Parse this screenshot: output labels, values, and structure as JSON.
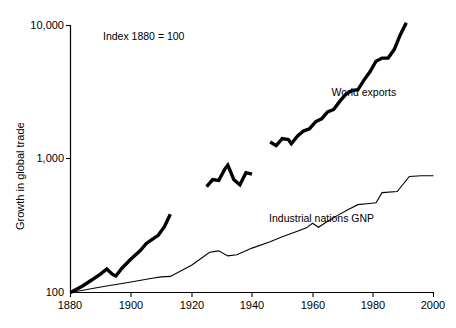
{
  "chart_data": {
    "type": "line",
    "title": "",
    "annotation": "Index 1880 = 100",
    "xlabel": "",
    "ylabel": "Growth in global trade",
    "yscale": "log",
    "ylim": [
      100,
      10000
    ],
    "xlim": [
      1880,
      2000
    ],
    "grid": false,
    "legend_position": "inline-labels",
    "xticks": [
      1880,
      1900,
      1920,
      1940,
      1960,
      1980,
      2000
    ],
    "xtick_labels": [
      "1880",
      "1900",
      "1920",
      "1940",
      "1960",
      "1980",
      "2000"
    ],
    "yticks": [
      100,
      1000,
      10000
    ],
    "ytick_labels": [
      "100",
      "1,000",
      "10,000"
    ],
    "series": [
      {
        "name": "World exports",
        "style": "thick",
        "label_x": 1977,
        "label_y": 2950,
        "segments": [
          {
            "from": 1880,
            "to": 1913,
            "x": [
              1880,
              1884,
              1887,
              1890,
              1892,
              1894,
              1895,
              1897,
              1900,
              1903,
              1905,
              1907,
              1909,
              1911,
              1913
            ],
            "y": [
              100,
              112,
              124,
              138,
              150,
              136,
              133,
              152,
              178,
              205,
              232,
              250,
              268,
              310,
              385
            ]
          },
          {
            "from": 1925,
            "to": 1940,
            "x": [
              1925,
              1927,
              1929,
              1931,
              1932,
              1934,
              1936,
              1938,
              1940
            ],
            "y": [
              620,
              700,
              690,
              840,
              900,
              700,
              640,
              790,
              770
            ]
          },
          {
            "from": 1946,
            "to": 1991,
            "x": [
              1946,
              1948,
              1950,
              1952,
              1953,
              1955,
              1957,
              1959,
              1961,
              1963,
              1965,
              1967,
              1969,
              1971,
              1973,
              1975,
              1977,
              1979,
              1981,
              1983,
              1985,
              1987,
              1989,
              1991
            ],
            "y": [
              1340,
              1260,
              1420,
              1400,
              1300,
              1480,
              1620,
              1680,
              1900,
              2000,
              2250,
              2350,
              2700,
              3050,
              3250,
              3300,
              3900,
              4500,
              5400,
              5700,
              5700,
              6600,
              8500,
              10500
            ]
          }
        ]
      },
      {
        "name": "Industrial nations GNP",
        "style": "thin",
        "label_x": 1963,
        "label_y": 340,
        "segments": [
          {
            "from": 1880,
            "to": 2000,
            "x": [
              1880,
              1890,
              1900,
              1907,
              1910,
              1913,
              1920,
              1926,
              1929,
              1932,
              1935,
              1940,
              1946,
              1950,
              1955,
              1958,
              1960,
              1962,
              1964,
              1968,
              1972,
              1975,
              1978,
              1981,
              1983,
              1988,
              1992,
              1996,
              2000
            ],
            "y": [
              100,
              110,
              120,
              128,
              131,
              132,
              160,
              200,
              205,
              188,
              192,
              215,
              240,
              262,
              288,
              305,
              330,
              308,
              330,
              375,
              420,
              455,
              462,
              470,
              560,
              570,
              740,
              750,
              750
            ]
          }
        ]
      }
    ]
  },
  "axis": {
    "y_title": "Growth in global trade"
  }
}
